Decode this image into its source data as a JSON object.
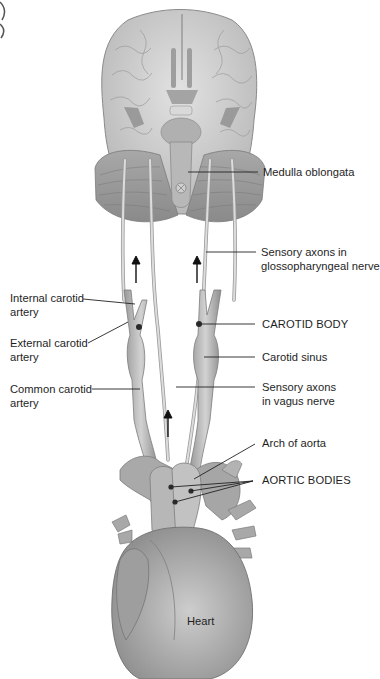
{
  "figure": {
    "background": "#ffffff",
    "leader_color": "#222222",
    "tissue_colors": {
      "brain": "#cfcfcf",
      "vessel": "#bdbdbd",
      "nerve": "#c8c8c8",
      "heart": "#b5b5b5",
      "receptor": "#2b2b2b"
    }
  },
  "labels": {
    "medulla": "Medulla oblongata",
    "glosso_line1": "Sensory axons in",
    "glosso_line2": "glossopharyngeal nerve",
    "internal_line1": "Internal carotid",
    "internal_line2": "artery",
    "external_line1": "External carotid",
    "external_line2": "artery",
    "common_line1": "Common carotid",
    "common_line2": "artery",
    "carotid_body": "CAROTID BODY",
    "carotid_sinus": "Carotid sinus",
    "vagus_line1": "Sensory axons",
    "vagus_line2": "in vagus nerve",
    "arch": "Arch of aorta",
    "aortic_bodies": "AORTIC BODIES",
    "heart": "Heart"
  },
  "arrows": [
    {
      "name": "left-upward-arrow",
      "x": 136,
      "y1": 283,
      "y2": 257
    },
    {
      "name": "right-upward-arrow",
      "x": 197,
      "y1": 283,
      "y2": 257
    },
    {
      "name": "center-upward-arrow",
      "x": 168,
      "y1": 437,
      "y2": 411
    }
  ]
}
